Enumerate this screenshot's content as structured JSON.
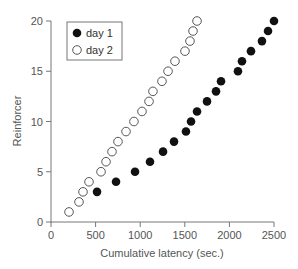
{
  "chart_data": {
    "type": "scatter",
    "title": "",
    "xlabel": "Cumulative latency (sec.)",
    "ylabel": "Reinforcer",
    "xlim": [
      0,
      2500
    ],
    "ylim": [
      0,
      20
    ],
    "xticks": [
      0,
      500,
      1000,
      1500,
      2000,
      2500
    ],
    "yticks": [
      0,
      5,
      10,
      15,
      20
    ],
    "grid": false,
    "legend_position": "upper left",
    "series": [
      {
        "name": "day 1",
        "marker": "filled-circle",
        "color": "#111111",
        "points": [
          [
            516,
            3
          ],
          [
            729,
            4
          ],
          [
            942,
            5
          ],
          [
            1110,
            6
          ],
          [
            1256,
            7
          ],
          [
            1379,
            8
          ],
          [
            1513,
            9
          ],
          [
            1570,
            10
          ],
          [
            1637,
            11
          ],
          [
            1749,
            12
          ],
          [
            1850,
            13
          ],
          [
            1906,
            14
          ],
          [
            2096,
            15
          ],
          [
            2141,
            16
          ],
          [
            2242,
            17
          ],
          [
            2365,
            18
          ],
          [
            2433,
            19
          ],
          [
            2500,
            20
          ]
        ]
      },
      {
        "name": "day 2",
        "marker": "open-circle",
        "color": "#444444",
        "points": [
          [
            202,
            1
          ],
          [
            314,
            2
          ],
          [
            359,
            3
          ],
          [
            426,
            4
          ],
          [
            561,
            5
          ],
          [
            617,
            6
          ],
          [
            684,
            7
          ],
          [
            751,
            8
          ],
          [
            841,
            9
          ],
          [
            930,
            10
          ],
          [
            1020,
            11
          ],
          [
            1099,
            12
          ],
          [
            1143,
            13
          ],
          [
            1244,
            14
          ],
          [
            1312,
            15
          ],
          [
            1390,
            16
          ],
          [
            1502,
            17
          ],
          [
            1558,
            18
          ],
          [
            1592,
            19
          ],
          [
            1637,
            20
          ]
        ]
      }
    ]
  },
  "legend": {
    "items": [
      {
        "label": "day 1",
        "marker": "filled-circle"
      },
      {
        "label": "day 2",
        "marker": "open-circle"
      }
    ]
  },
  "axes": {
    "x_title": "Cumulative latency (sec.)",
    "y_title": "Reinforcer"
  }
}
